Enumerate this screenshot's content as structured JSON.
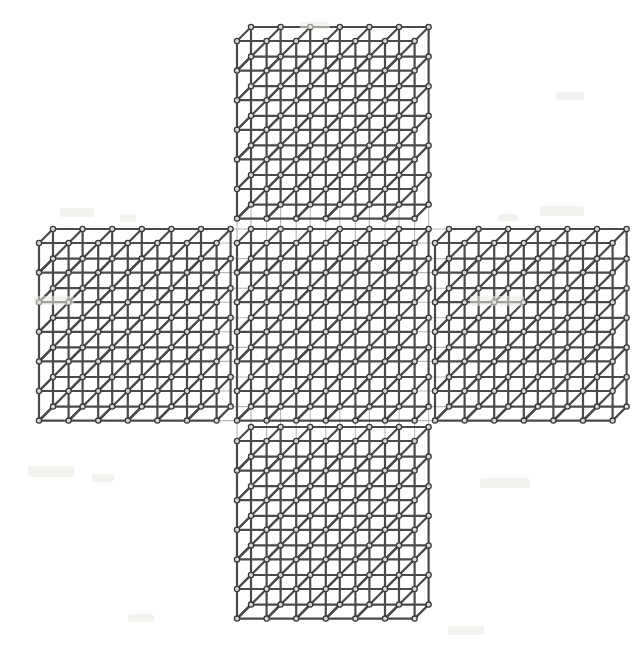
{
  "figure": {
    "background_color": "#ffffff",
    "edge_color": "#4a4a4a",
    "node_stroke_color": "#3a3a3a",
    "node_fill_color": "#d8d8d8",
    "ghost_line_color": "#b8b8b8",
    "canvas": {
      "width": 635,
      "height": 656
    }
  },
  "lattice": {
    "cells_per_panel_x": 6,
    "cells_per_panel_y": 6,
    "cell_width": 29.6,
    "cell_height": 29.6,
    "depth_dx": 14,
    "depth_dy": -14,
    "edge_width": 2.2,
    "node_radius": 2.6,
    "ghost_width": 1.1,
    "panels": [
      {
        "name": "top-panel",
        "col": 1,
        "row": 0,
        "origin_x": 237,
        "origin_y": 41
      },
      {
        "name": "left-panel",
        "col": 0,
        "row": 1,
        "origin_x": 39,
        "origin_y": 243
      },
      {
        "name": "center-panel",
        "col": 1,
        "row": 1,
        "origin_x": 237,
        "origin_y": 243
      },
      {
        "name": "right-panel",
        "col": 2,
        "row": 1,
        "origin_x": 435,
        "origin_y": 243
      },
      {
        "name": "bottom-panel",
        "col": 1,
        "row": 2,
        "origin_x": 237,
        "origin_y": 441
      }
    ],
    "ghost_bridges": [
      {
        "name": "bridge-left-to-center",
        "from_panel": "left-panel",
        "to_panel": "center-panel"
      },
      {
        "name": "bridge-center-to-right",
        "from_panel": "center-panel",
        "to_panel": "right-panel"
      },
      {
        "name": "bridge-top-to-center",
        "from_panel": "top-panel",
        "to_panel": "center-panel"
      },
      {
        "name": "bridge-center-to-bottom",
        "from_panel": "center-panel",
        "to_panel": "bottom-panel"
      }
    ]
  },
  "paper_specks": [
    {
      "x": 60,
      "y": 208,
      "w": 34,
      "h": 9
    },
    {
      "x": 120,
      "y": 214,
      "w": 16,
      "h": 8
    },
    {
      "x": 540,
      "y": 206,
      "w": 44,
      "h": 10
    },
    {
      "x": 498,
      "y": 214,
      "w": 20,
      "h": 7
    },
    {
      "x": 34,
      "y": 296,
      "w": 40,
      "h": 9
    },
    {
      "x": 28,
      "y": 466,
      "w": 46,
      "h": 11
    },
    {
      "x": 92,
      "y": 474,
      "w": 22,
      "h": 8
    },
    {
      "x": 470,
      "y": 296,
      "w": 54,
      "h": 10
    },
    {
      "x": 480,
      "y": 478,
      "w": 50,
      "h": 10
    },
    {
      "x": 128,
      "y": 614,
      "w": 26,
      "h": 8
    },
    {
      "x": 448,
      "y": 626,
      "w": 36,
      "h": 9
    },
    {
      "x": 300,
      "y": 22,
      "w": 30,
      "h": 7
    },
    {
      "x": 556,
      "y": 92,
      "w": 28,
      "h": 8
    }
  ]
}
